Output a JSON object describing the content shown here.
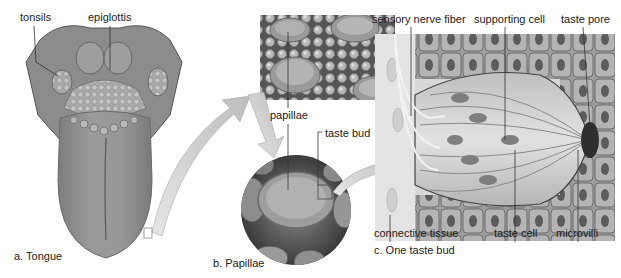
{
  "figure": {
    "panels": [
      {
        "id": "a",
        "caption": "a. Tongue",
        "labels": [
          "tonsils",
          "epiglottis"
        ]
      },
      {
        "id": "b",
        "caption": "b. Papillae",
        "labels": [
          "papillae",
          "taste bud"
        ]
      },
      {
        "id": "c",
        "caption": "c. One taste bud",
        "labels": [
          "sensory nerve fiber",
          "supporting cell",
          "taste pore",
          "connective tissue",
          "taste cell",
          "microvilli"
        ]
      }
    ],
    "colors": {
      "background": "#ffffff",
      "tissue_light": "#d9d9d9",
      "tissue_mid": "#a8a8a8",
      "tissue_dark": "#5a5a5a",
      "arrow": "#c8c8c8",
      "leader_line": "#333333"
    }
  }
}
